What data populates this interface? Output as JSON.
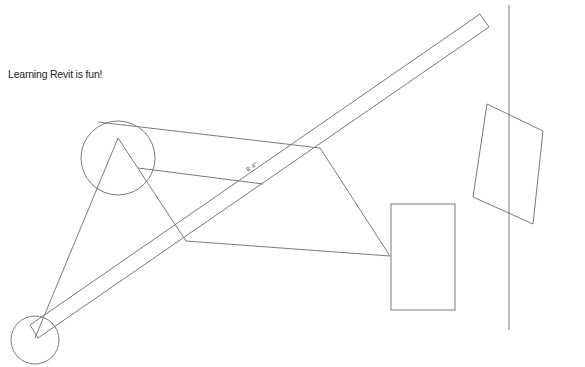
{
  "canvas": {
    "width": 585,
    "height": 367,
    "background": "#ffffff",
    "stroke": "#7a7a7a"
  },
  "text_note": {
    "text": "Learning Revit is fun!",
    "x": 8,
    "y": 68
  },
  "dimension": {
    "text": "8' 4\"",
    "x": 248,
    "y": 172,
    "angle": -34
  },
  "shapes": {
    "large_circle": {
      "cx": 118,
      "cy": 158,
      "r": 37
    },
    "small_circle": {
      "cx": 35,
      "cy": 340,
      "r": 24
    },
    "beam": [
      [
        30,
        325
      ],
      [
        480,
        14
      ],
      [
        489,
        27
      ],
      [
        38,
        338
      ]
    ],
    "triangle_left_edge": [
      [
        118,
        138
      ],
      [
        35,
        338
      ]
    ],
    "triangle_right_edge": [
      [
        118,
        138
      ],
      [
        186,
        241
      ]
    ],
    "bottom_edge": [
      [
        186,
        241
      ],
      [
        390,
        256
      ]
    ],
    "inner_edge": [
      [
        138,
        168
      ],
      [
        263,
        184
      ]
    ],
    "top_tangent": [
      [
        98,
        122
      ],
      [
        320,
        148
      ]
    ],
    "right_edge": [
      [
        320,
        148
      ],
      [
        390,
        256
      ]
    ],
    "rectangle": {
      "x": 391,
      "y": 204,
      "w": 64,
      "h": 106
    },
    "vertical_line": [
      [
        509,
        5
      ],
      [
        509,
        330
      ]
    ],
    "rotated_rectangle": [
      [
        487,
        104
      ],
      [
        543,
        131
      ],
      [
        533,
        224
      ],
      [
        473,
        197
      ]
    ]
  }
}
